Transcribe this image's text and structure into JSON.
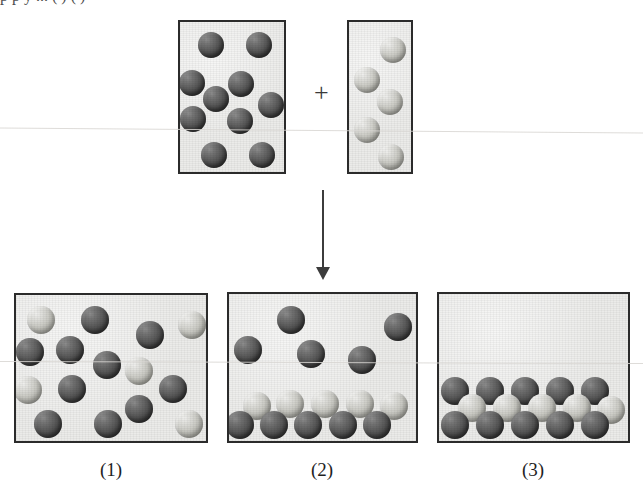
{
  "figure": {
    "kind": "particulate-reaction-diagram",
    "top_clipped_text": "p                                        p              y   ...   ( ) ( )",
    "operator_plus": "+",
    "arrow": "down-arrow"
  },
  "colors": {
    "sphere_dark": "#4a4a4a",
    "sphere_light": "#cbcbc5",
    "vessel_fill": "#ebebe9",
    "vessel_border": "#2b2b2b",
    "ink": "#1f1f1f",
    "scan_line": "#d8d6d2"
  },
  "reactants": {
    "vessel_a": {
      "name": "reactant-vessel-a",
      "box": {
        "x": 178,
        "y": 20,
        "w": 108,
        "h": 154
      },
      "dark_count": 9,
      "light_count": 0,
      "spheres": [
        {
          "cx": 211,
          "cy": 45,
          "r": 13,
          "shade": "dark"
        },
        {
          "cx": 259,
          "cy": 45,
          "r": 13,
          "shade": "dark"
        },
        {
          "cx": 192,
          "cy": 83,
          "r": 13,
          "shade": "dark"
        },
        {
          "cx": 241,
          "cy": 84,
          "r": 13,
          "shade": "dark"
        },
        {
          "cx": 216,
          "cy": 99,
          "r": 13,
          "shade": "dark"
        },
        {
          "cx": 271,
          "cy": 105,
          "r": 13,
          "shade": "dark"
        },
        {
          "cx": 193,
          "cy": 119,
          "r": 13,
          "shade": "dark"
        },
        {
          "cx": 240,
          "cy": 121,
          "r": 13,
          "shade": "dark"
        },
        {
          "cx": 214,
          "cy": 155,
          "r": 13,
          "shade": "dark"
        },
        {
          "cx": 262,
          "cy": 155,
          "r": 13,
          "shade": "dark"
        }
      ]
    },
    "vessel_b": {
      "name": "reactant-vessel-b",
      "box": {
        "x": 347,
        "y": 20,
        "w": 66,
        "h": 154
      },
      "dark_count": 0,
      "light_count": 5,
      "spheres": [
        {
          "cx": 393,
          "cy": 50,
          "r": 13,
          "shade": "light"
        },
        {
          "cx": 367,
          "cy": 80,
          "r": 13,
          "shade": "light"
        },
        {
          "cx": 390,
          "cy": 102,
          "r": 13,
          "shade": "light"
        },
        {
          "cx": 367,
          "cy": 130,
          "r": 13,
          "shade": "light"
        },
        {
          "cx": 391,
          "cy": 157,
          "r": 13,
          "shade": "light"
        }
      ]
    }
  },
  "products": [
    {
      "label": "(1)",
      "name": "product-panel-1",
      "description": "homogeneous mixture, particles randomly dispersed",
      "box": {
        "x": 14,
        "y": 293,
        "w": 194,
        "h": 150
      },
      "dark_count": 11,
      "light_count": 5,
      "total_count": 16,
      "spheres": [
        {
          "cx": 41,
          "cy": 320,
          "r": 14,
          "shade": "light"
        },
        {
          "cx": 95,
          "cy": 320,
          "r": 14,
          "shade": "dark"
        },
        {
          "cx": 150,
          "cy": 335,
          "r": 14,
          "shade": "dark"
        },
        {
          "cx": 192,
          "cy": 325,
          "r": 14,
          "shade": "light"
        },
        {
          "cx": 30,
          "cy": 352,
          "r": 14,
          "shade": "dark"
        },
        {
          "cx": 70,
          "cy": 350,
          "r": 14,
          "shade": "dark"
        },
        {
          "cx": 107,
          "cy": 365,
          "r": 14,
          "shade": "dark"
        },
        {
          "cx": 139,
          "cy": 371,
          "r": 14,
          "shade": "light"
        },
        {
          "cx": 28,
          "cy": 390,
          "r": 14,
          "shade": "light"
        },
        {
          "cx": 72,
          "cy": 389,
          "r": 14,
          "shade": "dark"
        },
        {
          "cx": 173,
          "cy": 389,
          "r": 14,
          "shade": "dark"
        },
        {
          "cx": 48,
          "cy": 424,
          "r": 14,
          "shade": "dark"
        },
        {
          "cx": 108,
          "cy": 424,
          "r": 14,
          "shade": "dark"
        },
        {
          "cx": 139,
          "cy": 409,
          "r": 14,
          "shade": "dark"
        },
        {
          "cx": 189,
          "cy": 424,
          "r": 14,
          "shade": "light"
        }
      ],
      "caption_x": 111,
      "caption_y": 459
    },
    {
      "label": "(2)",
      "name": "product-panel-2",
      "description": "bilayer at bottom (light over dark) with free dark particles above",
      "box": {
        "x": 227,
        "y": 292,
        "w": 191,
        "h": 151
      },
      "dark_count": 10,
      "light_count": 5,
      "total_count": 15,
      "spheres": [
        {
          "cx": 291,
          "cy": 320,
          "r": 14,
          "shade": "dark"
        },
        {
          "cx": 398,
          "cy": 327,
          "r": 14,
          "shade": "dark"
        },
        {
          "cx": 248,
          "cy": 350,
          "r": 14,
          "shade": "dark"
        },
        {
          "cx": 311,
          "cy": 354,
          "r": 14,
          "shade": "dark"
        },
        {
          "cx": 362,
          "cy": 360,
          "r": 14,
          "shade": "dark"
        },
        {
          "cx": 257,
          "cy": 406,
          "r": 14,
          "shade": "light"
        },
        {
          "cx": 290,
          "cy": 404,
          "r": 14,
          "shade": "light"
        },
        {
          "cx": 325,
          "cy": 404,
          "r": 14,
          "shade": "light"
        },
        {
          "cx": 360,
          "cy": 404,
          "r": 14,
          "shade": "light"
        },
        {
          "cx": 394,
          "cy": 406,
          "r": 14,
          "shade": "light"
        },
        {
          "cx": 240,
          "cy": 425,
          "r": 14,
          "shade": "dark"
        },
        {
          "cx": 274,
          "cy": 425,
          "r": 14,
          "shade": "dark"
        },
        {
          "cx": 308,
          "cy": 425,
          "r": 14,
          "shade": "dark"
        },
        {
          "cx": 343,
          "cy": 425,
          "r": 14,
          "shade": "dark"
        },
        {
          "cx": 377,
          "cy": 425,
          "r": 14,
          "shade": "dark"
        }
      ],
      "caption_x": 322,
      "caption_y": 459
    },
    {
      "label": "(3)",
      "name": "product-panel-3",
      "description": "ordered trilayer: dark layer / light layer / dark layer",
      "box": {
        "x": 437,
        "y": 292,
        "w": 193,
        "h": 151
      },
      "dark_count": 10,
      "light_count": 5,
      "total_count": 15,
      "spheres": [
        {
          "cx": 455,
          "cy": 391,
          "r": 14,
          "shade": "dark"
        },
        {
          "cx": 490,
          "cy": 391,
          "r": 14,
          "shade": "dark"
        },
        {
          "cx": 525,
          "cy": 391,
          "r": 14,
          "shade": "dark"
        },
        {
          "cx": 560,
          "cy": 391,
          "r": 14,
          "shade": "dark"
        },
        {
          "cx": 595,
          "cy": 391,
          "r": 14,
          "shade": "dark"
        },
        {
          "cx": 472,
          "cy": 408,
          "r": 14,
          "shade": "light"
        },
        {
          "cx": 507,
          "cy": 408,
          "r": 14,
          "shade": "light"
        },
        {
          "cx": 542,
          "cy": 408,
          "r": 14,
          "shade": "light"
        },
        {
          "cx": 577,
          "cy": 408,
          "r": 14,
          "shade": "light"
        },
        {
          "cx": 611,
          "cy": 410,
          "r": 14,
          "shade": "light"
        },
        {
          "cx": 455,
          "cy": 425,
          "r": 14,
          "shade": "dark"
        },
        {
          "cx": 490,
          "cy": 425,
          "r": 14,
          "shade": "dark"
        },
        {
          "cx": 525,
          "cy": 425,
          "r": 14,
          "shade": "dark"
        },
        {
          "cx": 560,
          "cy": 425,
          "r": 14,
          "shade": "dark"
        },
        {
          "cx": 595,
          "cy": 425,
          "r": 14,
          "shade": "dark"
        }
      ],
      "caption_x": 533,
      "caption_y": 459
    }
  ],
  "annotations": {
    "plus": {
      "x": 314,
      "y": 80,
      "text": "+"
    },
    "arrow": {
      "x": 322,
      "y_start": 190,
      "y_end": 278
    },
    "scan_lines": [
      130,
      362
    ]
  }
}
